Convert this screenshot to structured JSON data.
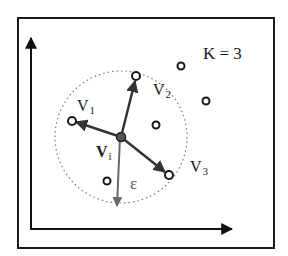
{
  "diagram": {
    "title_label": "K = 3",
    "colors": {
      "frame": "#1a1a1a",
      "axis": "#111111",
      "vector": "#333333",
      "epsilon_vector": "#6a6a6a",
      "circle": "#7a7a7a",
      "point_fill": "#ffffff",
      "point_stroke": "#1a1a1a",
      "center_fill": "#555555"
    },
    "center": {
      "label": "V",
      "subscript": "i"
    },
    "neighbors": [
      {
        "label": "V",
        "subscript": "1"
      },
      {
        "label": "V",
        "subscript": "2"
      },
      {
        "label": "V",
        "subscript": "3"
      }
    ],
    "radius_label": "ε",
    "other_points_count": 4
  }
}
